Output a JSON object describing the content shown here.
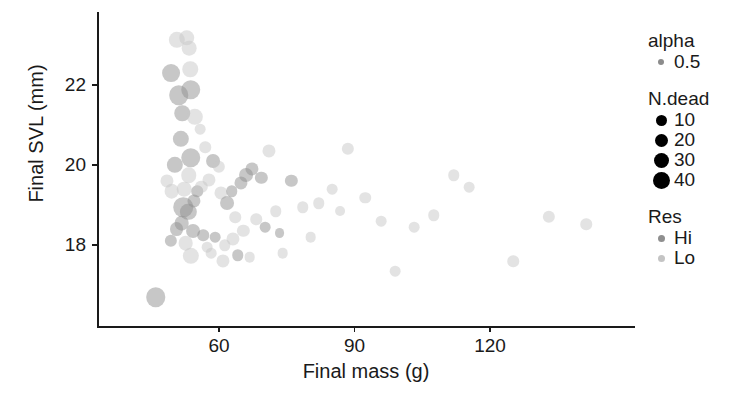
{
  "chart_data": {
    "type": "scatter",
    "title": "",
    "xlabel": "Final mass (g)",
    "ylabel": "Final SVL (mm)",
    "xticks": [
      60,
      90,
      120
    ],
    "yticks": [
      18,
      20,
      22
    ],
    "xlim": [
      40.9,
      158.9
    ],
    "ylim": [
      16.4,
      23.3
    ],
    "grid": false,
    "legend_position": "right",
    "encodings": {
      "x": "Final mass (g)",
      "y": "Final SVL (mm)",
      "size": "N.dead",
      "color": "Res",
      "alpha": 0.5
    },
    "legends": [
      {
        "title": "alpha",
        "type": "alpha",
        "entries": [
          {
            "label": "0.5",
            "size": 6,
            "color": "#8c8c8c"
          }
        ]
      },
      {
        "title": "N.dead",
        "type": "size",
        "entries": [
          {
            "label": "10",
            "size": 11,
            "color": "#000000"
          },
          {
            "label": "20",
            "size": 13,
            "color": "#000000"
          },
          {
            "label": "30",
            "size": 15,
            "color": "#000000"
          },
          {
            "label": "40",
            "size": 17,
            "color": "#000000"
          }
        ]
      },
      {
        "title": "Res",
        "type": "color",
        "entries": [
          {
            "label": "Hi",
            "size": 7,
            "color": "#8f8f8f"
          },
          {
            "label": "Lo",
            "size": 7,
            "color": "#c4c4c4"
          }
        ]
      }
    ],
    "colors": {
      "Hi": "#8f8f8f",
      "Lo": "#c8c8c8",
      "axis": "#1a1a1a",
      "background": "#ffffff"
    },
    "points": [
      {
        "x": 46.0,
        "y": 16.7,
        "n": 30,
        "res": "Hi"
      },
      {
        "x": 50.6,
        "y": 23.12,
        "n": 22,
        "res": "Lo"
      },
      {
        "x": 52.9,
        "y": 23.18,
        "n": 20,
        "res": "Lo"
      },
      {
        "x": 53.4,
        "y": 22.92,
        "n": 18,
        "res": "Lo"
      },
      {
        "x": 49.4,
        "y": 22.3,
        "n": 26,
        "res": "Hi"
      },
      {
        "x": 53.6,
        "y": 22.4,
        "n": 20,
        "res": "Lo"
      },
      {
        "x": 51.1,
        "y": 21.75,
        "n": 30,
        "res": "Hi"
      },
      {
        "x": 53.8,
        "y": 21.88,
        "n": 30,
        "res": "Hi"
      },
      {
        "x": 51.9,
        "y": 21.3,
        "n": 20,
        "res": "Hi"
      },
      {
        "x": 54.6,
        "y": 21.2,
        "n": 22,
        "res": "Lo"
      },
      {
        "x": 51.6,
        "y": 20.65,
        "n": 22,
        "res": "Hi"
      },
      {
        "x": 50.3,
        "y": 20.0,
        "n": 22,
        "res": "Hi"
      },
      {
        "x": 53.7,
        "y": 20.18,
        "n": 30,
        "res": "Hi"
      },
      {
        "x": 53.3,
        "y": 19.75,
        "n": 20,
        "res": "Lo"
      },
      {
        "x": 52.3,
        "y": 19.4,
        "n": 18,
        "res": "Lo"
      },
      {
        "x": 55.2,
        "y": 19.35,
        "n": 10,
        "res": "Hi"
      },
      {
        "x": 49.5,
        "y": 19.35,
        "n": 18,
        "res": "Lo"
      },
      {
        "x": 48.5,
        "y": 19.6,
        "n": 14,
        "res": "Lo"
      },
      {
        "x": 52.1,
        "y": 18.95,
        "n": 30,
        "res": "Hi"
      },
      {
        "x": 53.2,
        "y": 18.82,
        "n": 22,
        "res": "Hi"
      },
      {
        "x": 54.5,
        "y": 19.1,
        "n": 14,
        "res": "Hi"
      },
      {
        "x": 51.7,
        "y": 18.55,
        "n": 18,
        "res": "Hi"
      },
      {
        "x": 50.6,
        "y": 18.4,
        "n": 16,
        "res": "Hi"
      },
      {
        "x": 54.3,
        "y": 18.35,
        "n": 16,
        "res": "Hi"
      },
      {
        "x": 52.6,
        "y": 18.05,
        "n": 18,
        "res": "Lo"
      },
      {
        "x": 53.8,
        "y": 17.72,
        "n": 22,
        "res": "Lo"
      },
      {
        "x": 49.3,
        "y": 18.1,
        "n": 12,
        "res": "Hi"
      },
      {
        "x": 56.5,
        "y": 18.25,
        "n": 10,
        "res": "Hi"
      },
      {
        "x": 57.4,
        "y": 17.95,
        "n": 8,
        "res": "Lo"
      },
      {
        "x": 56.1,
        "y": 19.45,
        "n": 12,
        "res": "Lo"
      },
      {
        "x": 57.8,
        "y": 19.62,
        "n": 14,
        "res": "Lo"
      },
      {
        "x": 58.6,
        "y": 20.1,
        "n": 16,
        "res": "Hi"
      },
      {
        "x": 59.9,
        "y": 19.95,
        "n": 12,
        "res": "Lo"
      },
      {
        "x": 60.5,
        "y": 19.3,
        "n": 14,
        "res": "Lo"
      },
      {
        "x": 61.7,
        "y": 19.05,
        "n": 16,
        "res": "Hi"
      },
      {
        "x": 62.8,
        "y": 19.35,
        "n": 10,
        "res": "Hi"
      },
      {
        "x": 63.6,
        "y": 18.7,
        "n": 10,
        "res": "Lo"
      },
      {
        "x": 64.8,
        "y": 19.55,
        "n": 14,
        "res": "Hi"
      },
      {
        "x": 66.0,
        "y": 19.75,
        "n": 16,
        "res": "Hi"
      },
      {
        "x": 67.3,
        "y": 19.9,
        "n": 14,
        "res": "Hi"
      },
      {
        "x": 69.4,
        "y": 19.68,
        "n": 12,
        "res": "Hi"
      },
      {
        "x": 71.0,
        "y": 20.35,
        "n": 14,
        "res": "Lo"
      },
      {
        "x": 68.2,
        "y": 18.65,
        "n": 10,
        "res": "Lo"
      },
      {
        "x": 65.4,
        "y": 18.35,
        "n": 12,
        "res": "Lo"
      },
      {
        "x": 63.1,
        "y": 18.15,
        "n": 14,
        "res": "Lo"
      },
      {
        "x": 61.3,
        "y": 18.0,
        "n": 10,
        "res": "Lo"
      },
      {
        "x": 59.1,
        "y": 18.2,
        "n": 8,
        "res": "Hi"
      },
      {
        "x": 58.2,
        "y": 17.8,
        "n": 8,
        "res": "Lo"
      },
      {
        "x": 60.9,
        "y": 17.6,
        "n": 14,
        "res": "Lo"
      },
      {
        "x": 64.2,
        "y": 17.75,
        "n": 10,
        "res": "Hi"
      },
      {
        "x": 66.8,
        "y": 17.7,
        "n": 8,
        "res": "Lo"
      },
      {
        "x": 70.2,
        "y": 18.45,
        "n": 8,
        "res": "Hi"
      },
      {
        "x": 72.6,
        "y": 18.85,
        "n": 10,
        "res": "Lo"
      },
      {
        "x": 74.1,
        "y": 17.8,
        "n": 8,
        "res": "Lo"
      },
      {
        "x": 73.4,
        "y": 18.3,
        "n": 6,
        "res": "Hi"
      },
      {
        "x": 76.0,
        "y": 19.6,
        "n": 12,
        "res": "Hi"
      },
      {
        "x": 78.5,
        "y": 18.95,
        "n": 10,
        "res": "Lo"
      },
      {
        "x": 80.3,
        "y": 18.2,
        "n": 8,
        "res": "Lo"
      },
      {
        "x": 82.1,
        "y": 19.05,
        "n": 10,
        "res": "Lo"
      },
      {
        "x": 85.0,
        "y": 19.4,
        "n": 8,
        "res": "Lo"
      },
      {
        "x": 88.6,
        "y": 20.4,
        "n": 12,
        "res": "Lo"
      },
      {
        "x": 92.4,
        "y": 19.18,
        "n": 10,
        "res": "Lo"
      },
      {
        "x": 95.9,
        "y": 18.6,
        "n": 8,
        "res": "Lo"
      },
      {
        "x": 99.0,
        "y": 17.35,
        "n": 8,
        "res": "Lo"
      },
      {
        "x": 103.2,
        "y": 18.45,
        "n": 8,
        "res": "Lo"
      },
      {
        "x": 107.5,
        "y": 18.75,
        "n": 10,
        "res": "Lo"
      },
      {
        "x": 112.0,
        "y": 19.75,
        "n": 10,
        "res": "Lo"
      },
      {
        "x": 115.4,
        "y": 19.45,
        "n": 8,
        "res": "Lo"
      },
      {
        "x": 125.2,
        "y": 17.6,
        "n": 10,
        "res": "Lo"
      },
      {
        "x": 133.0,
        "y": 18.7,
        "n": 12,
        "res": "Lo"
      },
      {
        "x": 141.3,
        "y": 18.52,
        "n": 10,
        "res": "Lo"
      },
      {
        "x": 86.8,
        "y": 18.85,
        "n": 6,
        "res": "Lo"
      },
      {
        "x": 57.0,
        "y": 20.45,
        "n": 10,
        "res": "Lo"
      },
      {
        "x": 55.8,
        "y": 20.9,
        "n": 8,
        "res": "Lo"
      }
    ]
  }
}
